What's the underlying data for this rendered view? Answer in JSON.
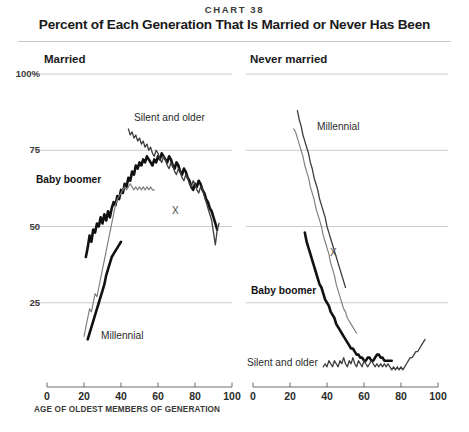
{
  "header": {
    "chart_number": "CHART 38",
    "title": "Percent of Each Generation That Is Married or Never Has Been"
  },
  "panels": {
    "left": {
      "title": "Married",
      "annotations": [
        {
          "name": "silent-and-older",
          "text": "Silent and older"
        },
        {
          "name": "baby-boomer",
          "text": "Baby boomer"
        },
        {
          "name": "millennial",
          "text": "Millennial"
        },
        {
          "name": "gen-x",
          "text": "X"
        }
      ]
    },
    "right": {
      "title": "Never married",
      "annotations": [
        {
          "name": "millennial",
          "text": "Millennial"
        },
        {
          "name": "gen-x",
          "text": "X"
        },
        {
          "name": "baby-boomer",
          "text": "Baby boomer"
        },
        {
          "name": "silent-and-older",
          "text": "Silent and older"
        }
      ]
    }
  },
  "axis": {
    "y_ticks": [
      "100%",
      "75",
      "50",
      "25"
    ],
    "x_ticks": [
      "0",
      "20",
      "40",
      "60",
      "80",
      "100"
    ],
    "x_caption": "AGE OF OLDEST MEMBERS OF GENERATION"
  },
  "colors": {
    "thick_line": "#111111",
    "thin_line": "#7d7d7d",
    "mid_line": "#3e3e3e",
    "gridline": "#bfbfbf",
    "axis": "#6d6d6d",
    "text": "#231f20",
    "background": "#ffffff"
  },
  "chart_data": {
    "type": "line",
    "title": "Percent of Each Generation That Is Married or Never Has Been",
    "subtitle": "CHART 38",
    "xlabel": "AGE OF OLDEST MEMBERS OF GENERATION",
    "ylabel": "Percent",
    "xlim": [
      0,
      100
    ],
    "ylim": [
      0,
      100
    ],
    "yticks": [
      25,
      50,
      75,
      100
    ],
    "xticks": [
      0,
      20,
      40,
      60,
      80,
      100
    ],
    "grid": "horizontal",
    "legend": "inline-annotations",
    "panels": [
      {
        "name": "Married",
        "series": [
          {
            "name": "Baby boomer",
            "style": "thick",
            "x": [
              21,
              22,
              23,
              24,
              25,
              26,
              27,
              28,
              29,
              30,
              31,
              32,
              33,
              34,
              35,
              36,
              37,
              38,
              39,
              40,
              41,
              42,
              43,
              44,
              45,
              46,
              47,
              48,
              49,
              50,
              51,
              52,
              53,
              54,
              55,
              56,
              57,
              58,
              59,
              60,
              61,
              62,
              63,
              64,
              65,
              66,
              67,
              68,
              69,
              70,
              71,
              72,
              73,
              74,
              75,
              76,
              77,
              78,
              79,
              80,
              81,
              82,
              83,
              84,
              85,
              86,
              87,
              88,
              89,
              90,
              91,
              92
            ],
            "y": [
              40,
              43,
              47,
              45,
              49,
              48,
              51,
              50,
              53,
              51,
              54,
              52,
              55,
              53,
              56,
              58,
              57,
              60,
              59,
              62,
              61,
              64,
              63,
              66,
              65,
              68,
              67,
              70,
              69,
              71,
              70,
              72,
              71,
              73,
              72,
              71,
              70,
              72,
              71,
              73,
              72,
              74,
              73,
              72,
              71,
              73,
              72,
              70,
              69,
              71,
              70,
              68,
              67,
              69,
              68,
              66,
              65,
              63,
              62,
              64,
              63,
              65,
              64,
              62,
              61,
              59,
              58,
              56,
              55,
              53,
              51,
              49
            ]
          },
          {
            "name": "Gen X",
            "style": "thin",
            "x": [
              20,
              21,
              22,
              23,
              24,
              25,
              26,
              27,
              28,
              29,
              30,
              31,
              32,
              33,
              34,
              35,
              36,
              37,
              38,
              39,
              40,
              41,
              42,
              43,
              44,
              45,
              46,
              47,
              48,
              49,
              50,
              51,
              52,
              53,
              54,
              55,
              56,
              57,
              58
            ],
            "y": [
              14,
              17,
              20,
              23,
              22,
              25,
              28,
              27,
              30,
              33,
              36,
              39,
              42,
              45,
              48,
              51,
              54,
              57,
              59,
              60,
              61,
              62,
              63,
              62,
              63,
              64,
              63,
              62,
              63,
              62,
              63,
              62,
              63,
              62,
              63,
              62,
              63,
              62,
              62
            ]
          },
          {
            "name": "Millennial",
            "style": "thick",
            "x": [
              22,
              23,
              24,
              25,
              26,
              27,
              28,
              29,
              30,
              31,
              32,
              33,
              34,
              35,
              36,
              37,
              38,
              39,
              40
            ],
            "y": [
              13,
              15,
              17,
              19,
              21,
              23,
              25,
              27,
              29,
              31,
              34,
              36,
              38,
              40,
              41,
              42,
              43,
              44,
              45
            ]
          },
          {
            "name": "Silent and older",
            "style": "mid",
            "x": [
              44,
              45,
              46,
              47,
              48,
              49,
              50,
              51,
              52,
              53,
              54,
              55,
              56,
              57,
              58,
              59,
              60,
              61,
              62,
              63,
              64,
              65,
              66,
              67,
              68,
              69,
              70,
              71,
              72,
              73,
              74,
              75,
              76,
              77,
              78,
              79,
              80,
              81,
              82,
              83,
              84,
              85,
              86,
              87,
              88,
              89,
              90,
              91,
              92,
              93
            ],
            "y": [
              82,
              80,
              81,
              79,
              80,
              78,
              79,
              77,
              78,
              76,
              77,
              75,
              76,
              74,
              73,
              75,
              74,
              72,
              71,
              73,
              72,
              70,
              69,
              71,
              70,
              68,
              67,
              69,
              68,
              66,
              65,
              67,
              66,
              64,
              63,
              65,
              64,
              62,
              61,
              63,
              62,
              60,
              58,
              56,
              54,
              52,
              48,
              44,
              49,
              51
            ]
          }
        ]
      },
      {
        "name": "Never married",
        "series": [
          {
            "name": "Millennial",
            "style": "mid",
            "x": [
              24,
              25,
              26,
              27,
              28,
              29,
              30,
              31,
              32,
              33,
              34,
              35,
              36,
              37,
              38,
              39,
              40,
              41,
              42,
              43,
              44,
              45,
              46,
              47,
              48,
              49,
              50
            ],
            "y": [
              88,
              85,
              83,
              80,
              78,
              76,
              74,
              71,
              69,
              66,
              64,
              62,
              59,
              57,
              55,
              53,
              50,
              48,
              46,
              44,
              42,
              40,
              38,
              36,
              34,
              32,
              30
            ]
          },
          {
            "name": "Gen X",
            "style": "thin",
            "x": [
              22,
              23,
              24,
              25,
              26,
              27,
              28,
              29,
              30,
              31,
              32,
              33,
              34,
              35,
              36,
              37,
              38,
              39,
              40,
              41,
              42,
              43,
              44,
              45,
              46,
              47,
              48,
              49,
              50,
              51,
              52,
              53,
              54,
              55,
              56
            ],
            "y": [
              82,
              81,
              79,
              77,
              75,
              73,
              70,
              68,
              66,
              63,
              61,
              59,
              56,
              54,
              52,
              50,
              47,
              45,
              43,
              41,
              38,
              36,
              34,
              31,
              29,
              27,
              25,
              23,
              22,
              20,
              19,
              18,
              17,
              16,
              15
            ]
          },
          {
            "name": "Baby boomer",
            "style": "thick",
            "x": [
              28,
              29,
              30,
              31,
              32,
              33,
              34,
              35,
              36,
              37,
              38,
              39,
              40,
              41,
              42,
              43,
              44,
              45,
              46,
              47,
              48,
              49,
              50,
              51,
              52,
              53,
              54,
              55,
              56,
              57,
              58,
              59,
              60,
              61,
              62,
              63,
              64,
              65,
              66,
              67,
              68,
              69,
              70,
              71,
              72,
              73,
              74,
              75
            ],
            "y": [
              48,
              45,
              43,
              41,
              39,
              37,
              35,
              33,
              31,
              30,
              28,
              26,
              25,
              24,
              22,
              21,
              20,
              18,
              17,
              16,
              15,
              14,
              13,
              12,
              11,
              10,
              10,
              9,
              8,
              8,
              7,
              7,
              6,
              6,
              7,
              7,
              6,
              6,
              7,
              8,
              8,
              7,
              7,
              6,
              6,
              6,
              6,
              6
            ]
          },
          {
            "name": "Silent and older",
            "style": "mid",
            "x": [
              38,
              39,
              40,
              41,
              42,
              43,
              44,
              45,
              46,
              47,
              48,
              49,
              50,
              51,
              52,
              53,
              54,
              55,
              56,
              57,
              58,
              59,
              60,
              61,
              62,
              63,
              64,
              65,
              66,
              67,
              68,
              69,
              70,
              71,
              72,
              73,
              74,
              75,
              76,
              77,
              78,
              79,
              80,
              81,
              82,
              83,
              84,
              85,
              86,
              87,
              88,
              89,
              90,
              91,
              92,
              93
            ],
            "y": [
              4,
              5,
              4,
              6,
              5,
              4,
              6,
              5,
              4,
              6,
              5,
              7,
              5,
              4,
              6,
              5,
              7,
              5,
              4,
              6,
              5,
              4,
              6,
              5,
              4,
              5,
              6,
              5,
              4,
              5,
              4,
              5,
              4,
              5,
              4,
              5,
              4,
              3,
              4,
              3,
              4,
              3,
              4,
              3,
              4,
              5,
              6,
              7,
              7,
              8,
              9,
              9,
              10,
              11,
              12,
              13
            ]
          }
        ]
      }
    ]
  }
}
